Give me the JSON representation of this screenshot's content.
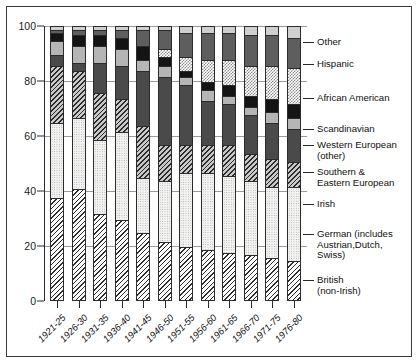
{
  "chart_data": {
    "type": "bar",
    "subtype": "stacked-percentage-column",
    "title": "",
    "xlabel": "",
    "ylabel": "",
    "ylim": [
      0,
      100
    ],
    "yticks": [
      0,
      20,
      40,
      60,
      80,
      100
    ],
    "grid": true,
    "legend_position": "right",
    "categories": [
      "1921-25",
      "1926-30",
      "1931-35",
      "1936-40",
      "1941-45",
      "1946-50",
      "1951-55",
      "1956-60",
      "1961-65",
      "1966-70",
      "1971-75",
      "1976-80"
    ],
    "series": [
      {
        "name": "British (non-Irish)",
        "pattern": "diagonal-hatch",
        "values": [
          38,
          41,
          32,
          30,
          25,
          22,
          20,
          19,
          18,
          17,
          16,
          15
        ]
      },
      {
        "name": "German (includes Austrian,Dutch, Swiss)",
        "pattern": "light-stipple",
        "values": [
          27,
          26,
          27,
          32,
          20,
          22,
          27,
          28,
          28,
          27,
          26,
          27
        ]
      },
      {
        "name": "Irish",
        "pattern": "dark-hatch-grey",
        "values": [
          21,
          17,
          17,
          12,
          19,
          13,
          10,
          10,
          11,
          10,
          10,
          9
        ]
      },
      {
        "name": "Southern & Eastern European",
        "pattern": "dark-grey-solid",
        "values": [
          4,
          3,
          11,
          12,
          20,
          25,
          22,
          16,
          15,
          14,
          13,
          12
        ]
      },
      {
        "name": "Western European (other)",
        "pattern": "light-grey-solid",
        "values": [
          5,
          6,
          6,
          6,
          4,
          4,
          3,
          4,
          3,
          3,
          4,
          4
        ]
      },
      {
        "name": "Scandinavian",
        "pattern": "black-solid",
        "values": [
          3,
          4,
          4,
          4,
          5,
          3,
          2,
          3,
          4,
          4,
          5,
          5
        ]
      },
      {
        "name": "African American",
        "pattern": "checkerboard",
        "values": [
          0,
          0,
          0,
          0,
          0,
          3,
          5,
          8,
          9,
          11,
          12,
          13
        ]
      },
      {
        "name": "Hispanic",
        "pattern": "mid-grey-solid",
        "values": [
          1,
          2,
          2,
          3,
          6,
          7,
          9,
          10,
          10,
          11,
          11,
          11
        ]
      },
      {
        "name": "Other",
        "pattern": "pale-grey-solid",
        "values": [
          1,
          1,
          1,
          1,
          1,
          1,
          2,
          2,
          2,
          3,
          3,
          4
        ]
      }
    ]
  },
  "legend": {
    "items": [
      {
        "label": "Other"
      },
      {
        "label": "Hispanic"
      },
      {
        "label": "African American"
      },
      {
        "label": "Scandinavian"
      },
      {
        "label": "Western European\n(other)"
      },
      {
        "label": "Southern &\nEastern European"
      },
      {
        "label": "Irish"
      },
      {
        "label": "German (includes\nAustrian,Dutch,\nSwiss)"
      },
      {
        "label": "British\n(non-Irish)"
      }
    ]
  },
  "colors": {
    "frame": "#3a3a3a",
    "axis": "#2b2b2b",
    "grid": "#9b9b9b",
    "text": "#111111"
  }
}
